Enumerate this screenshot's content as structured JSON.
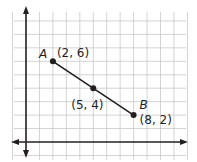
{
  "chart_data": {
    "type": "line",
    "title": "",
    "xlabel": "",
    "ylabel": "",
    "xlim": [
      -1,
      12
    ],
    "ylim": [
      -1,
      10
    ],
    "grid": true,
    "legend": null,
    "colors": {
      "grid": "#c8c8c8",
      "axis": "#231f20",
      "segment": "#231f20",
      "point": "#231f20"
    },
    "series": [
      {
        "name": "segment AB",
        "points": [
          {
            "x": 2,
            "y": 6
          },
          {
            "x": 8,
            "y": 2
          }
        ]
      }
    ],
    "points": [
      {
        "name": "A",
        "x": 2,
        "y": 6,
        "label": "(2, 6)"
      },
      {
        "name": "",
        "x": 5,
        "y": 4,
        "label": "(5, 4)"
      },
      {
        "name": "B",
        "x": 8,
        "y": 2,
        "label": "(8, 2)"
      }
    ]
  }
}
